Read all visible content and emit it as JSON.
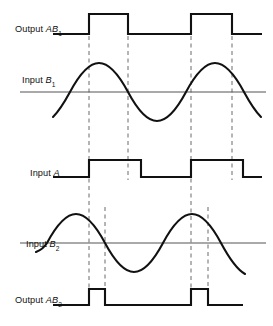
{
  "figure": {
    "type": "timing-diagram",
    "background_color": "#ffffff",
    "trace_color": "#111111",
    "axis_color": "#4a4a4a",
    "dash_color": "#6b6b6b"
  },
  "rows": [
    {
      "id": "output-ab1",
      "label_prefix": "Output ",
      "label_italic": "AB",
      "label_sub": "1",
      "label_full": "Output AB1",
      "waveform": "square-pulse",
      "baseline_y": 34,
      "high_y": 14,
      "pulses": [
        [
          89,
          128
        ],
        [
          191,
          232
        ]
      ]
    },
    {
      "id": "input-b1",
      "label_prefix": "Input ",
      "label_italic": "B",
      "label_sub": "1",
      "label_full": "Input B1",
      "waveform": "sine",
      "baseline_y": 92,
      "amplitude": 30,
      "period": 116,
      "zero_cross_rising_x": 70,
      "peak_x": 99,
      "zero_cross_falling_x": 128
    },
    {
      "id": "input-a",
      "label_prefix": "Input ",
      "label_italic": "A",
      "label_sub": "",
      "label_full": "Input A",
      "waveform": "square",
      "baseline_y": 177,
      "high_y": 160,
      "pulses": [
        [
          89,
          141
        ],
        [
          191,
          243
        ]
      ]
    },
    {
      "id": "input-b2",
      "label_prefix": "Input ",
      "label_italic": "B",
      "label_sub": "2",
      "label_full": "Input B2",
      "waveform": "sine",
      "baseline_y": 243,
      "amplitude": 29,
      "period": 116,
      "zero_cross_rising_x": 47,
      "peak_x": 76,
      "zero_cross_falling_x": 105
    },
    {
      "id": "output-ab2",
      "label_prefix": "Output ",
      "label_italic": "AB",
      "label_sub": "2",
      "label_full": "Output AB2",
      "waveform": "square-pulse",
      "baseline_y": 305,
      "high_y": 289,
      "pulses": [
        [
          89,
          105
        ],
        [
          191,
          208
        ]
      ]
    }
  ],
  "markers": {
    "description": "Vertical dashed alignment lines",
    "lines": [
      {
        "x": 89,
        "y1": 20,
        "y2": 290
      },
      {
        "x": 128,
        "y1": 20,
        "y2": 180
      },
      {
        "x": 191,
        "y1": 20,
        "y2": 290
      },
      {
        "x": 232,
        "y1": 20,
        "y2": 180
      },
      {
        "x": 105,
        "y1": 205,
        "y2": 290
      },
      {
        "x": 208,
        "y1": 205,
        "y2": 290
      }
    ]
  }
}
